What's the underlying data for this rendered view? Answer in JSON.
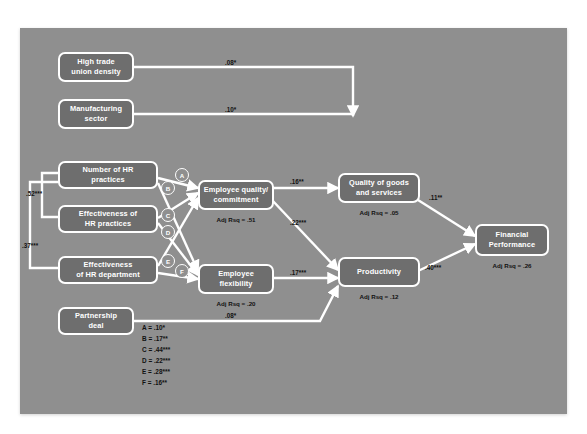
{
  "diagram": {
    "canvas_color": "#8f8f8f",
    "node_color": "#6e6e6e",
    "wire_color": "#ffffff",
    "label_color": "#111111"
  },
  "nodes": {
    "union": {
      "label": "High trade\nunion density"
    },
    "manufacturing": {
      "label": "Manufacturing\nsector"
    },
    "hr_number": {
      "label": "Number of HR\npractices"
    },
    "hr_effectiveness": {
      "label": "Effectiveness of\nHR practices"
    },
    "hr_department": {
      "label": "Effectiveness\nof HR department"
    },
    "partnership": {
      "label": "Partnership\ndeal"
    },
    "emp_quality": {
      "label": "Employee quality/\ncommitment",
      "rsq": "Adj Rsq = .51"
    },
    "emp_flexibility": {
      "label": "Employee\nflexibility",
      "rsq": "Adj Rsq = .20"
    },
    "quality_goods": {
      "label": "Quality of goods\nand services",
      "rsq": "Adj Rsq = .05"
    },
    "productivity": {
      "label": "Productivity",
      "rsq": "Adj Rsq = .12"
    },
    "financial": {
      "label": "Financial\nPerformance",
      "rsq": "Adj Rsq = .26"
    }
  },
  "path_labels": {
    "union_to_quality": ".08*",
    "manufacturing_to_quality": ".10*",
    "hrnum_to_hreff": ".52***",
    "hrnum_to_hrdept": ".37***",
    "quality_to_goods": ".16**",
    "quality_to_productivity": ".22***",
    "flex_to_productivity": ".17***",
    "goods_to_financial": ".11**",
    "productivity_to_financial": ".40***",
    "partnership_to_productivity": ".08*"
  },
  "markers": {
    "a": "A",
    "b": "B",
    "c": "C",
    "d": "D",
    "e": "E",
    "f": "F"
  },
  "legend": {
    "a": "A = .10*",
    "b": "B = .17**",
    "c": "C = .44***",
    "d": "D = .22***",
    "e": "E = .28***",
    "f": "F = .16**"
  }
}
